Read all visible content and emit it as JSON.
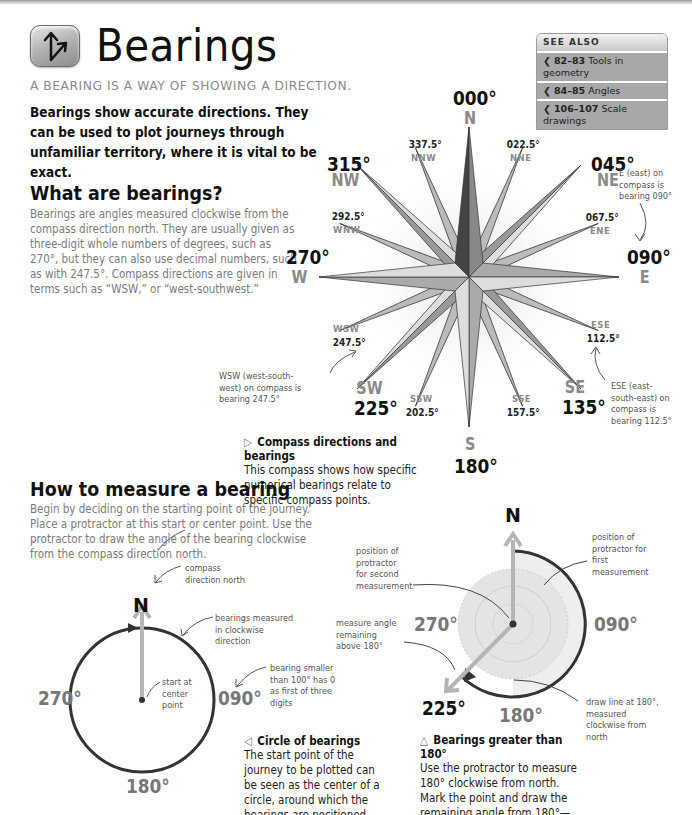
{
  "header": {
    "icon": "bearing-arrows-icon",
    "title": "Bearings",
    "subtitle": "A BEARING IS A WAY OF SHOWING A DIRECTION.",
    "intro": "Bearings show accurate directions. They can be used to plot journeys through unfamiliar territory, where it is vital to be exact."
  },
  "see_also": {
    "heading": "SEE ALSO",
    "items": [
      {
        "pages": "82–83",
        "label": "Tools in geometry"
      },
      {
        "pages": "84–85",
        "label": "Angles"
      },
      {
        "pages": "106–107",
        "label": "Scale drawings"
      }
    ]
  },
  "section1": {
    "heading": "What are bearings?",
    "body": "Bearings are angles measured clockwise from the compass direction north. They are usually given as three-digit whole numbers of degrees, such as 270°, but they can also use decimal numbers, such as with 247.5°. Compass directions are given in terms such as “WSW,” or “west-southwest.”"
  },
  "compass": {
    "main": [
      {
        "deg": "000°",
        "dir": "N"
      },
      {
        "deg": "045°",
        "dir": "NE"
      },
      {
        "deg": "090°",
        "dir": "E"
      },
      {
        "deg": "135°",
        "dir": "SE"
      },
      {
        "deg": "180°",
        "dir": "S"
      },
      {
        "deg": "225°",
        "dir": "SW"
      },
      {
        "deg": "270°",
        "dir": "W"
      },
      {
        "deg": "315°",
        "dir": "NW"
      }
    ],
    "minor": [
      {
        "deg": "022.5°",
        "dir": "NNE"
      },
      {
        "deg": "067.5°",
        "dir": "ENE"
      },
      {
        "deg": "112.5°",
        "dir": "ESE"
      },
      {
        "deg": "157.5°",
        "dir": "SSE"
      },
      {
        "deg": "202.5°",
        "dir": "SSW"
      },
      {
        "deg": "247.5°",
        "dir": "WSW"
      },
      {
        "deg": "292.5°",
        "dir": "WNW"
      },
      {
        "deg": "337.5°",
        "dir": "NNW"
      }
    ],
    "notes": {
      "east": "E (east) on compass is bearing 090°",
      "wsw": "WSW (west-south-west) on compass is bearing 247.5°",
      "ese": "ESE (east-south-east) on compass is bearing 112.5°"
    },
    "caption_title": "Compass directions and bearings",
    "caption_text": "This compass shows how specific numerical bearings relate to specific compass points.",
    "caption_glyph": "▷"
  },
  "section2": {
    "heading": "How to measure a bearing",
    "body": "Begin by deciding on the starting point of the journey. Place a protractor at this start or center point. Use the protractor to draw the angle of the bearing clockwise from the compass direction north."
  },
  "circle_diagram": {
    "north": "N",
    "east": "090°",
    "south": "180°",
    "west": "270°",
    "notes": {
      "north": "compass direction north",
      "clockwise": "bearings measured in clockwise direction",
      "center": "start at center point",
      "smaller": "bearing smaller than 100° has 0 as first of three digits"
    },
    "caption_glyph": "◁",
    "caption_title": "Circle of bearings",
    "caption_text": "The start point of the journey to be plotted can be seen as the center of a circle, around which the bearings are positioned."
  },
  "protractor_diagram": {
    "north": "N",
    "east": "090°",
    "south": "180°",
    "west": "270°",
    "result": "225°",
    "notes": {
      "second": "position of protractor for second measurement",
      "first": "position of protractor for first measurement",
      "remaining": "measure angle remaining above 180°",
      "drawline": "draw line at 180°, measured clockwise from north"
    },
    "caption_glyph": "△",
    "caption_title": "Bearings greater than 180°",
    "caption_text": "Use the protractor to measure 180° clockwise from north. Mark the point and draw the remaining angle from 180°—in this example it is 225°."
  }
}
